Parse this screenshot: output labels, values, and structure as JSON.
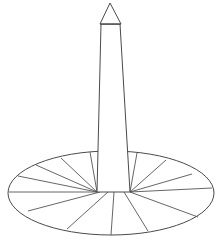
{
  "figure": {
    "title": "Washington Monument line drawing",
    "caption": "Obelisk with pyramidion on an elliptical plaza with radiating walkways",
    "background_color": "#ffffff",
    "line_color": "#4a4a4a",
    "canvas": {
      "width": 222,
      "height": 242
    }
  },
  "monument": {
    "pyramidion": {
      "label": "pyramidion",
      "apex": {
        "x": 110,
        "y": 3
      },
      "left_base": {
        "x": 100,
        "y": 24
      },
      "right_base": {
        "x": 121,
        "y": 24
      },
      "points": "110,3 121,24 100,24"
    },
    "shaft": {
      "label": "obelisk shaft",
      "top_left": {
        "x": 101,
        "y": 24
      },
      "top_right": {
        "x": 120,
        "y": 24
      },
      "bottom_right": {
        "x": 130,
        "y": 192
      },
      "bottom_left": {
        "x": 97,
        "y": 192
      },
      "points": "101,24 120,24 130,192 97,192"
    }
  },
  "plaza": {
    "label": "elliptical plaza",
    "center": {
      "x": 111,
      "y": 193
    },
    "radius_x": 104,
    "radius_y": 42,
    "walkway_count": 12,
    "walkways": [
      {
        "name": "walkway-nw-1",
        "from": {
          "x": 97,
          "y": 192
        },
        "to": {
          "x": 18,
          "y": 176
        }
      },
      {
        "name": "walkway-nw-2",
        "from": {
          "x": 97,
          "y": 192
        },
        "to": {
          "x": 36,
          "y": 165
        }
      },
      {
        "name": "walkway-nw-3",
        "from": {
          "x": 97,
          "y": 192
        },
        "to": {
          "x": 61,
          "y": 158
        }
      },
      {
        "name": "walkway-n-1",
        "from": {
          "x": 97,
          "y": 192
        },
        "to": {
          "x": 90,
          "y": 152
        }
      },
      {
        "name": "walkway-ne-1",
        "from": {
          "x": 130,
          "y": 192
        },
        "to": {
          "x": 137,
          "y": 153
        }
      },
      {
        "name": "walkway-ne-2",
        "from": {
          "x": 130,
          "y": 192
        },
        "to": {
          "x": 166,
          "y": 160
        }
      },
      {
        "name": "walkway-ne-3",
        "from": {
          "x": 130,
          "y": 192
        },
        "to": {
          "x": 192,
          "y": 174
        }
      },
      {
        "name": "walkway-e-1",
        "from": {
          "x": 130,
          "y": 192
        },
        "to": {
          "x": 212,
          "y": 188
        }
      },
      {
        "name": "walkway-se-1",
        "from": {
          "x": 130,
          "y": 192
        },
        "to": {
          "x": 198,
          "y": 217
        }
      },
      {
        "name": "walkway-se-2",
        "from": {
          "x": 124,
          "y": 192
        },
        "to": {
          "x": 148,
          "y": 231
        }
      },
      {
        "name": "walkway-s-1",
        "from": {
          "x": 114,
          "y": 192
        },
        "to": {
          "x": 111,
          "y": 235
        }
      },
      {
        "name": "walkway-sw-1",
        "from": {
          "x": 108,
          "y": 192
        },
        "to": {
          "x": 67,
          "y": 229
        }
      },
      {
        "name": "walkway-sw-2",
        "from": {
          "x": 100,
          "y": 192
        },
        "to": {
          "x": 28,
          "y": 211
        }
      },
      {
        "name": "walkway-w-1",
        "from": {
          "x": 97,
          "y": 192
        },
        "to": {
          "x": 9,
          "y": 192
        }
      }
    ]
  }
}
